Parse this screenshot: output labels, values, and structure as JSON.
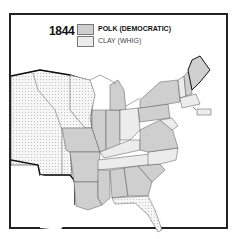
{
  "map": {
    "year": "1844",
    "legend": [
      {
        "label": "POLK (DEMOCRATIC)",
        "color": "#cfcfcf"
      },
      {
        "label": "CLAY (WHIG)",
        "color": "#ececec"
      }
    ],
    "territory_pattern": "dotted",
    "colors": {
      "polk": "#cfcfcf",
      "clay": "#ececec",
      "territory": "#f4f4f4",
      "border": "#222222"
    }
  }
}
